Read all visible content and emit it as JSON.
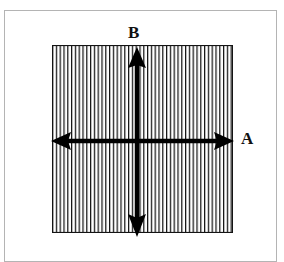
{
  "figure": {
    "title": "",
    "background_color": "#ffffff",
    "frame": {
      "name": "page-border",
      "color": "#b4b4b4",
      "x": 4,
      "y": 10,
      "width": 273,
      "height": 252
    },
    "hatched_region": {
      "name": "vertical-hatch-square",
      "fill_pattern": "vertical-lines",
      "line_color": "#1a1a1a",
      "line_spacing_px": 3.8,
      "line_width_px": 1.2,
      "border_color": "#1a1a1a",
      "x": 52,
      "y": 45,
      "width": 181,
      "height": 188
    },
    "arrows": [
      {
        "name": "horizontal-double-arrow",
        "label": "A",
        "orientation": "horizontal",
        "color": "#000000",
        "x1": 52,
        "y1": 141,
        "x2": 234,
        "y2": 141,
        "heads": "both"
      },
      {
        "name": "vertical-double-arrow",
        "label": "B",
        "orientation": "vertical",
        "color": "#000000",
        "x1": 137,
        "y1": 47,
        "x2": 137,
        "y2": 236,
        "heads": "both"
      }
    ],
    "labels": [
      {
        "name": "label-b",
        "text": "B",
        "x": 128,
        "y": 24
      },
      {
        "name": "label-a",
        "text": "A",
        "x": 241,
        "y": 130
      }
    ]
  }
}
